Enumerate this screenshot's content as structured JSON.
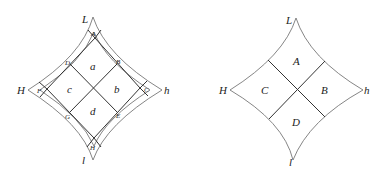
{
  "left_diagram": {
    "vertex_labels": {
      "top": "L",
      "left": "H",
      "right": "h",
      "bottom": "l"
    },
    "region_labels": {
      "top": "a",
      "right": "b",
      "left": "c",
      "bottom": "d"
    },
    "small_labels": {
      "top": "A",
      "top_right": "B",
      "right": "C",
      "top_left": "D",
      "bottom_right": "E",
      "left": "F",
      "bottom_left": "G",
      "bottom": "H"
    }
  },
  "right_diagram": {
    "vertex_labels": {
      "top": "L",
      "left": "H",
      "right": "h",
      "bottom": "l"
    },
    "region_labels": {
      "top": "A",
      "right": "B",
      "left": "C",
      "bottom": "D"
    }
  }
}
